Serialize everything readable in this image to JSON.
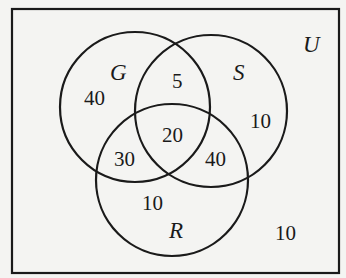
{
  "diagram": {
    "type": "venn",
    "universe": {
      "label": "U"
    },
    "sets": [
      {
        "name": "G",
        "label": "G"
      },
      {
        "name": "S",
        "label": "S"
      },
      {
        "name": "R",
        "label": "R"
      }
    ],
    "regions": {
      "G_only": "40",
      "S_only": "10",
      "R_only": "10",
      "G_and_S_only": "5",
      "G_and_R_only": "30",
      "S_and_R_only": "40",
      "G_and_S_and_R": "20",
      "outside": "10"
    },
    "colors": {
      "stroke": "#1a1a1a",
      "background": "#f4f4f2"
    }
  }
}
